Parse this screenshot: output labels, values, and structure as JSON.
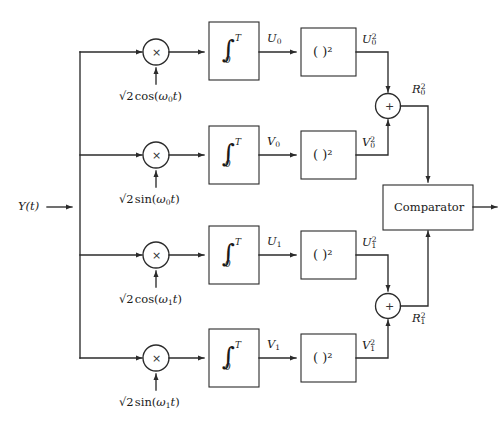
{
  "figure": {
    "type": "block-diagram",
    "background_color": "#ffffff",
    "line_color": "#2b2b2b"
  },
  "input": {
    "label_base": "Y",
    "label_arg": "(t)",
    "name": "input-signal"
  },
  "branches": [
    {
      "id": "branch-0-cos",
      "multiplier_glyph": "×",
      "carrier": {
        "radical": "√",
        "radicand": "2",
        "func": "cos",
        "open": "(",
        "omega": "ω",
        "omega_sub": "0",
        "var": "t",
        "close": ")",
        "full_text": "√2 cos(ω0t)"
      },
      "integrator": {
        "symbol": "∫",
        "upper_limit": "T",
        "lower_limit": "0"
      },
      "integrator_output": {
        "base": "U",
        "sub": "0",
        "sup": ""
      },
      "squarer_label": "( )²",
      "squarer_output": {
        "base": "U",
        "sub": "0",
        "sup": "2"
      }
    },
    {
      "id": "branch-0-sin",
      "multiplier_glyph": "×",
      "carrier": {
        "radical": "√",
        "radicand": "2",
        "func": "sin",
        "open": "(",
        "omega": "ω",
        "omega_sub": "0",
        "var": "t",
        "close": ")",
        "full_text": "√2 sin(ω0t)"
      },
      "integrator": {
        "symbol": "∫",
        "upper_limit": "T",
        "lower_limit": "0"
      },
      "integrator_output": {
        "base": "V",
        "sub": "0",
        "sup": ""
      },
      "squarer_label": "( )²",
      "squarer_output": {
        "base": "V",
        "sub": "0",
        "sup": "2"
      }
    },
    {
      "id": "branch-1-cos",
      "multiplier_glyph": "×",
      "carrier": {
        "radical": "√",
        "radicand": "2",
        "func": "cos",
        "open": "(",
        "omega": "ω",
        "omega_sub": "1",
        "var": "t",
        "close": ")",
        "full_text": "√2 cos(ω1t)"
      },
      "integrator": {
        "symbol": "∫",
        "upper_limit": "T",
        "lower_limit": "0"
      },
      "integrator_output": {
        "base": "U",
        "sub": "1",
        "sup": ""
      },
      "squarer_label": "( )²",
      "squarer_output": {
        "base": "U",
        "sub": "1",
        "sup": "2"
      }
    },
    {
      "id": "branch-1-sin",
      "multiplier_glyph": "×",
      "carrier": {
        "radical": "√",
        "radicand": "2",
        "func": "sin",
        "open": "(",
        "omega": "ω",
        "omega_sub": "1",
        "var": "t",
        "close": ")",
        "full_text": "√2 sin(ω1t)"
      },
      "integrator": {
        "symbol": "∫",
        "upper_limit": "T",
        "lower_limit": "0"
      },
      "integrator_output": {
        "base": "V",
        "sub": "1",
        "sup": ""
      },
      "squarer_label": "( )²",
      "squarer_output": {
        "base": "V",
        "sub": "1",
        "sup": "2"
      }
    }
  ],
  "adders": [
    {
      "id": "adder-0",
      "glyph": "+",
      "output": {
        "base": "R",
        "sub": "0",
        "sup": "2"
      }
    },
    {
      "id": "adder-1",
      "glyph": "+",
      "output": {
        "base": "R",
        "sub": "1",
        "sup": "2"
      }
    }
  ],
  "comparator": {
    "label": "Comparator",
    "name": "comparator-block"
  }
}
